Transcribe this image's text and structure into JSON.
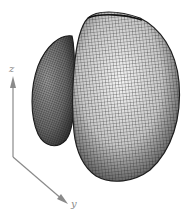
{
  "figure": {
    "type": "3d-mesh-surface",
    "axes": {
      "z": {
        "label": "z"
      },
      "y": {
        "label": "y"
      }
    },
    "colors": {
      "axis": "#8a8a8a",
      "mesh_line": "#2a2a2a",
      "mesh_fill_light": "#f2f2f2",
      "mesh_fill_dark": "#3a3a3a",
      "background": "#ffffff"
    },
    "lobes": [
      {
        "name": "main-lobe"
      },
      {
        "name": "back-lobe"
      }
    ]
  }
}
